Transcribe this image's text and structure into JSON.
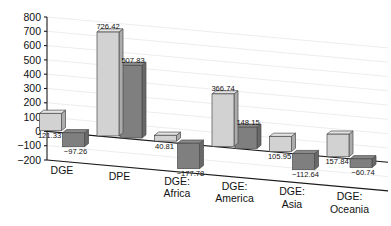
{
  "chart_data": {
    "type": "bar",
    "title": "",
    "subtitle": "",
    "xlabel": "",
    "ylabel": "",
    "ylim": [
      -200,
      800
    ],
    "yticks": [
      800,
      700,
      600,
      500,
      400,
      300,
      200,
      100,
      0,
      -100,
      -200
    ],
    "ytick_labels": [
      "800",
      "700",
      "600",
      "500",
      "400",
      "300",
      "200",
      "100",
      "0",
      "−100",
      "−200"
    ],
    "grid": true,
    "legend": "none",
    "projection": "3d-perspective",
    "categories": [
      "DGE",
      "DPE",
      "DGE: Africa",
      "DGE: America",
      "DGE: Asia",
      "DGE: Oceania"
    ],
    "category_lines": [
      [
        "DGE"
      ],
      [
        "DPE"
      ],
      [
        "DGE:",
        "Africa"
      ],
      [
        "DGE:",
        "America"
      ],
      [
        "DGE:",
        "Asia"
      ],
      [
        "DGE:",
        "Oceania"
      ]
    ],
    "series": [
      {
        "name": "series-light",
        "color": "#d2d2d2",
        "values": [
          121.33,
          726.42,
          40.81,
          366.74,
          105.95,
          157.84
        ],
        "labels": [
          "121.33",
          "726.42",
          "40.81",
          "366.74",
          "105.95",
          "157.84"
        ]
      },
      {
        "name": "series-dark",
        "color": "#7f7f7f",
        "values": [
          -97.26,
          507.83,
          -177.78,
          148.15,
          -112.64,
          -60.74
        ],
        "labels": [
          "−97.26",
          "507.83",
          "−177.78",
          "148.15",
          "−112.64",
          "−60.74"
        ]
      }
    ],
    "colors": {
      "light_bar": "#d2d2d2",
      "dark_bar": "#7f7f7f",
      "bar_edge": "#4a4a4a",
      "axis": "#1a1a1a",
      "grid": "#e9e9ee",
      "background": "#ffffff",
      "text": "#111111"
    }
  }
}
